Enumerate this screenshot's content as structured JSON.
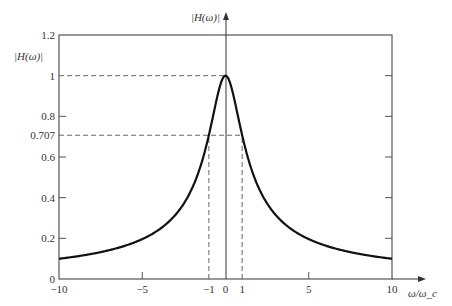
{
  "chart_data": {
    "type": "line",
    "title": "",
    "xlabel": "ω/ω_c",
    "ylabel": "|H(ω)|",
    "top_axis_label": "|H(ω)|",
    "xlim": [
      -10,
      10
    ],
    "ylim": [
      0,
      1.2
    ],
    "grid": false,
    "x_ticks": [
      {
        "value": -10,
        "label": "−10"
      },
      {
        "value": -5,
        "label": "−5"
      },
      {
        "value": -1,
        "label": "−1"
      },
      {
        "value": 0,
        "label": "0"
      },
      {
        "value": 1,
        "label": "1"
      },
      {
        "value": 5,
        "label": "5"
      },
      {
        "value": 10,
        "label": "10"
      }
    ],
    "y_ticks": [
      {
        "value": 0,
        "label": "0"
      },
      {
        "value": 0.2,
        "label": "0.2"
      },
      {
        "value": 0.4,
        "label": "0.4"
      },
      {
        "value": 0.6,
        "label": "0.6"
      },
      {
        "value": 0.707,
        "label": "0.707"
      },
      {
        "value": 0.8,
        "label": "0.8"
      },
      {
        "value": 1,
        "label": "1"
      },
      {
        "value": 1.2,
        "label": "1.2"
      }
    ],
    "series": [
      {
        "name": "|H(ω)| = 1/√(1+(ω/ω_c)²)",
        "x": [
          -10,
          -8,
          -6,
          -5,
          -4,
          -3,
          -2,
          -1.5,
          -1,
          -0.5,
          0,
          0.5,
          1,
          1.5,
          2,
          3,
          4,
          5,
          6,
          8,
          10
        ],
        "y": [
          0.0995,
          0.124,
          0.164,
          0.196,
          0.243,
          0.316,
          0.447,
          0.555,
          0.707,
          0.894,
          1.0,
          0.894,
          0.707,
          0.555,
          0.447,
          0.316,
          0.243,
          0.196,
          0.164,
          0.124,
          0.0995
        ]
      }
    ],
    "annotations": [
      {
        "type": "dashed-hline",
        "y": 1,
        "x_from": -10,
        "x_to": 0
      },
      {
        "type": "dashed-hline",
        "y": 0.707,
        "x_from": -10,
        "x_to": 1
      },
      {
        "type": "dashed-vline",
        "x": -1,
        "y_from": 0,
        "y_to": 0.707
      },
      {
        "type": "dashed-vline",
        "x": 1,
        "y_from": 0,
        "y_to": 0.707
      }
    ]
  }
}
